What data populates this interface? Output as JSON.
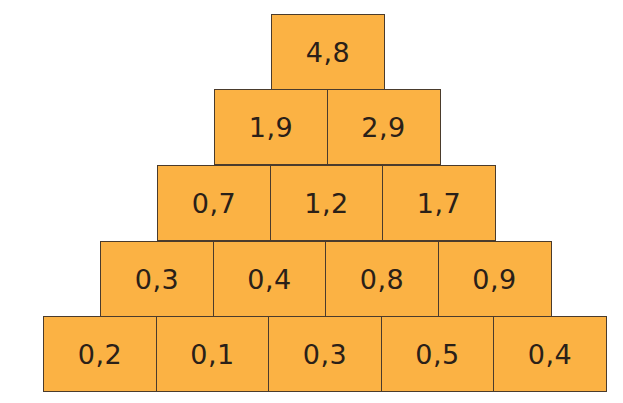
{
  "diagram": {
    "type": "number-pyramid",
    "fill_color": "#fbb244",
    "border_color": "#4a3b2c",
    "rows": [
      {
        "level": 1,
        "values": [
          "4,8"
        ]
      },
      {
        "level": 2,
        "values": [
          "1,9",
          "2,9"
        ]
      },
      {
        "level": 3,
        "values": [
          "0,7",
          "1,2",
          "1,7"
        ]
      },
      {
        "level": 4,
        "values": [
          "0,3",
          "0,4",
          "0,8",
          "0,9"
        ]
      },
      {
        "level": 5,
        "values": [
          "0,2",
          "0,1",
          "0,3",
          "0,5",
          "0,4"
        ]
      }
    ]
  }
}
